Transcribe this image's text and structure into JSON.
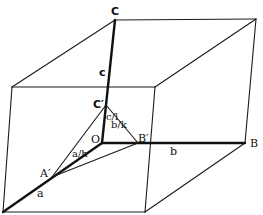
{
  "diagram": {
    "title": "",
    "points": {
      "C": {
        "label": "C"
      },
      "C_prime": {
        "label": "C′"
      },
      "O": {
        "label": "O"
      },
      "A_prime": {
        "label": "A′"
      },
      "B_prime": {
        "label": "B′"
      },
      "B": {
        "label": "B"
      }
    },
    "edge_labels": {
      "a": "a",
      "b": "b",
      "c": "c",
      "a_h": "a/h",
      "b_k": "b/k",
      "c_l": "c/l"
    },
    "colors": {
      "line": "#1a1a1a",
      "background": "#ffffff"
    }
  }
}
